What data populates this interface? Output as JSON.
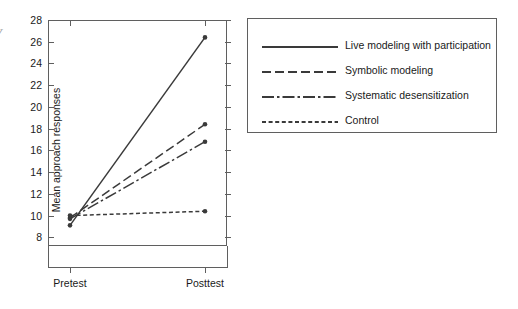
{
  "edge_fragment": "y",
  "chart_data": {
    "type": "line",
    "title": "",
    "xlabel": "",
    "ylabel": "Mean approach responses",
    "categories": [
      "Pretest",
      "Posttest"
    ],
    "x": [
      0,
      1
    ],
    "ylim": [
      7.2,
      28
    ],
    "yticks": [
      8,
      10,
      12,
      14,
      16,
      18,
      20,
      22,
      24,
      26,
      28
    ],
    "ytick_labels": [
      "8",
      "10",
      "12",
      "14",
      "16",
      "18",
      "20",
      "22",
      "24",
      "26",
      "28"
    ],
    "grid": false,
    "legend_position": "right",
    "marker": "circle",
    "series": [
      {
        "name": "Live modeling with participation",
        "values": [
          9.1,
          26.4
        ],
        "style": "solid",
        "color": "#3a3a3a"
      },
      {
        "name": "Symbolic modeling",
        "values": [
          9.8,
          18.4
        ],
        "style": "long-dash",
        "color": "#3a3a3a"
      },
      {
        "name": "Systematic desensitization",
        "values": [
          9.7,
          16.8
        ],
        "style": "dash-dot",
        "color": "#3a3a3a"
      },
      {
        "name": "Control",
        "values": [
          10.0,
          10.4
        ],
        "style": "short-dash",
        "color": "#3a3a3a"
      }
    ]
  },
  "legend": {
    "items": [
      {
        "label": "Live modeling with participation"
      },
      {
        "label": "Symbolic modeling"
      },
      {
        "label": "Systematic desensitization"
      },
      {
        "label": "Control"
      }
    ]
  },
  "axes": {
    "y_title": "Mean approach responses",
    "x_categories": [
      "Pretest",
      "Posttest"
    ]
  }
}
